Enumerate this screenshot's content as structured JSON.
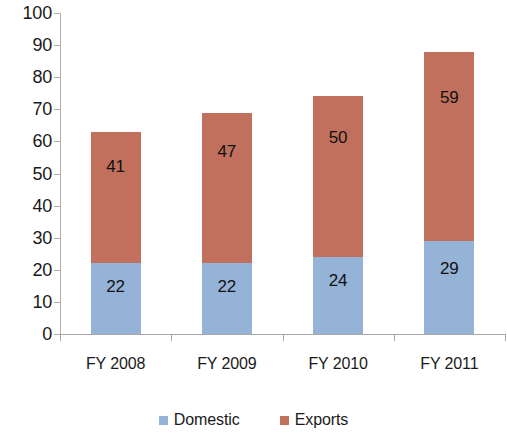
{
  "chart_data": {
    "type": "bar",
    "subtype": "stacked-column",
    "title": "",
    "xlabel": "",
    "ylabel": "",
    "categories": [
      "FY 2008",
      "FY 2009",
      "FY 2010",
      "FY 2011"
    ],
    "series": [
      {
        "name": "Domestic",
        "color": "#95b3d7",
        "values": [
          22,
          22,
          24,
          29
        ]
      },
      {
        "name": "Exports",
        "color": "#c0705c",
        "values": [
          41,
          47,
          50,
          59
        ]
      }
    ],
    "totals": [
      63,
      69,
      74,
      88
    ],
    "ylim": [
      0,
      100
    ],
    "y_ticks": [
      0,
      10,
      20,
      30,
      40,
      50,
      60,
      70,
      80,
      90,
      100
    ],
    "y_tick_labels": [
      "0",
      "10",
      "20",
      "30",
      "40",
      "50",
      "60",
      "70",
      "80",
      "90",
      "100"
    ],
    "grid": false,
    "legend_position": "bottom",
    "data_labels": [
      {
        "category": "FY 2008",
        "domestic": "22",
        "exports": "41"
      },
      {
        "category": "FY 2009",
        "domestic": "22",
        "exports": "47"
      },
      {
        "category": "FY 2010",
        "domestic": "24",
        "exports": "50"
      },
      {
        "category": "FY 2011",
        "domestic": "29",
        "exports": "59"
      }
    ]
  },
  "legend": {
    "items": [
      {
        "label": "Domestic",
        "color": "#95b3d7",
        "swatch": "square-marker"
      },
      {
        "label": "Exports",
        "color": "#c0705c",
        "swatch": "square-marker"
      }
    ]
  },
  "colors": {
    "domestic": "#95b3d7",
    "exports": "#c0705c",
    "axis": "#b0b0b0",
    "text": "#1a1a1a",
    "background": "#ffffff"
  }
}
